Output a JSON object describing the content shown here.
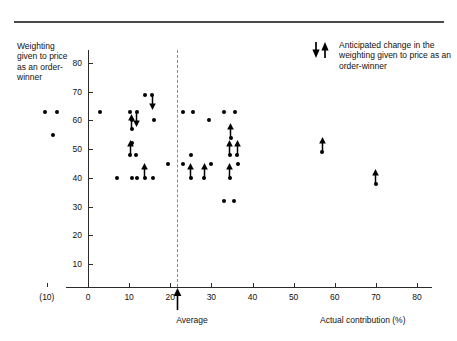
{
  "axes": {
    "y_title": "Weighting given to price as an order-winner",
    "x_title": "Actual contribution (%)",
    "average_label": "Average",
    "x_ticks": [
      "(10)",
      "0",
      "10",
      "20",
      "30",
      "40",
      "50",
      "60",
      "70",
      "80"
    ],
    "x_tick_values": [
      -10,
      0,
      10,
      20,
      30,
      40,
      50,
      60,
      70,
      80
    ],
    "y_ticks": [
      "10",
      "20",
      "30",
      "40",
      "50",
      "60",
      "70",
      "80"
    ],
    "y_tick_values": [
      10,
      20,
      30,
      40,
      50,
      60,
      70,
      80
    ]
  },
  "legend": {
    "text": "Anticipated change in the weighting given to price as an order-winner",
    "down_icon": "arrow-down-icon",
    "up_icon": "arrow-up-icon"
  },
  "chart_data": {
    "type": "scatter",
    "title": "",
    "xlabel": "Actual contribution (%)",
    "ylabel": "Weighting given to price as an order-winner",
    "xlim": [
      -12,
      82
    ],
    "ylim": [
      0,
      85
    ],
    "grid": false,
    "legend_position": "top-right",
    "average_x": 23,
    "annotations": [
      {
        "name": "average-marker",
        "x": 23,
        "label": "Average",
        "type": "arrow-up"
      }
    ],
    "points": [
      {
        "x": -10.5,
        "y": 63,
        "arrow": "none"
      },
      {
        "x": -7.5,
        "y": 63,
        "arrow": "none"
      },
      {
        "x": -8.5,
        "y": 55,
        "arrow": "none"
      },
      {
        "x": 3.0,
        "y": 63,
        "arrow": "none"
      },
      {
        "x": 7.0,
        "y": 40,
        "arrow": "none"
      },
      {
        "x": 10.3,
        "y": 63,
        "arrow": "none"
      },
      {
        "x": 11.8,
        "y": 63,
        "arrow": "down"
      },
      {
        "x": 10.8,
        "y": 60,
        "arrow": "none"
      },
      {
        "x": 10.6,
        "y": 57,
        "arrow": "up"
      },
      {
        "x": 10.6,
        "y": 52,
        "arrow": "none"
      },
      {
        "x": 10.3,
        "y": 48,
        "arrow": "up"
      },
      {
        "x": 11.6,
        "y": 48,
        "arrow": "none"
      },
      {
        "x": 10.6,
        "y": 40,
        "arrow": "none"
      },
      {
        "x": 12.0,
        "y": 40,
        "arrow": "none"
      },
      {
        "x": 13.8,
        "y": 40,
        "arrow": "up"
      },
      {
        "x": 15.8,
        "y": 40,
        "arrow": "none"
      },
      {
        "x": 13.8,
        "y": 69,
        "arrow": "none"
      },
      {
        "x": 15.6,
        "y": 69,
        "arrow": "down"
      },
      {
        "x": 16.0,
        "y": 60,
        "arrow": "none"
      },
      {
        "x": 19.5,
        "y": 45,
        "arrow": "none"
      },
      {
        "x": 23.0,
        "y": 63,
        "arrow": "none"
      },
      {
        "x": 23.0,
        "y": 45,
        "arrow": "none"
      },
      {
        "x": 25.5,
        "y": 63,
        "arrow": "none"
      },
      {
        "x": 25.0,
        "y": 48,
        "arrow": "none"
      },
      {
        "x": 25.0,
        "y": 40,
        "arrow": "up"
      },
      {
        "x": 28.3,
        "y": 40,
        "arrow": "up"
      },
      {
        "x": 29.5,
        "y": 60,
        "arrow": "none"
      },
      {
        "x": 30.0,
        "y": 45,
        "arrow": "none"
      },
      {
        "x": 33.0,
        "y": 63,
        "arrow": "none"
      },
      {
        "x": 35.7,
        "y": 63,
        "arrow": "none"
      },
      {
        "x": 34.7,
        "y": 54,
        "arrow": "up"
      },
      {
        "x": 34.5,
        "y": 48,
        "arrow": "up"
      },
      {
        "x": 36.3,
        "y": 48,
        "arrow": "up"
      },
      {
        "x": 34.5,
        "y": 40,
        "arrow": "up"
      },
      {
        "x": 36.5,
        "y": 45,
        "arrow": "none"
      },
      {
        "x": 33.0,
        "y": 32,
        "arrow": "none"
      },
      {
        "x": 35.5,
        "y": 32,
        "arrow": "none"
      },
      {
        "x": 57.0,
        "y": 49,
        "arrow": "up"
      },
      {
        "x": 70.0,
        "y": 38,
        "arrow": "up"
      }
    ]
  }
}
